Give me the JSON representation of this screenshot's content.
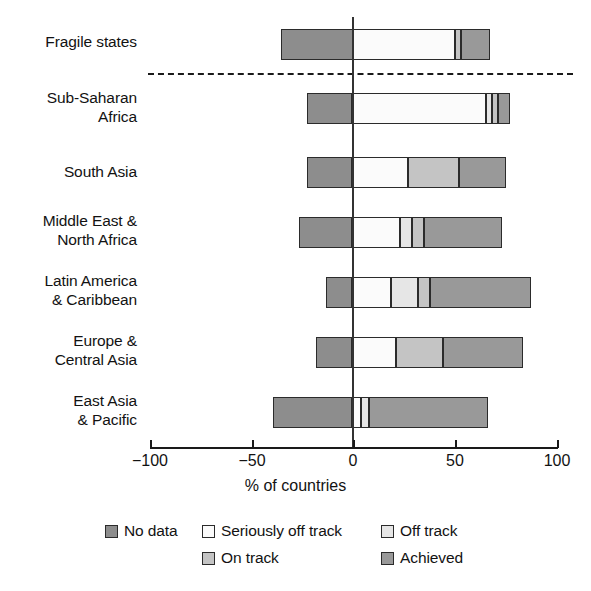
{
  "chart_data": {
    "type": "bar",
    "orientation": "horizontal",
    "stacked": true,
    "diverging": true,
    "title": "",
    "subtitle": "",
    "xlabel": "% of countries",
    "ylabel": "",
    "xlim": [
      -100,
      100
    ],
    "xticks": [
      -100,
      -50,
      0,
      50,
      100
    ],
    "xtick_labels": [
      "−100",
      "−50",
      "0",
      "50",
      "100"
    ],
    "grid": false,
    "legend_position": "bottom",
    "categories": [
      "Fragile states",
      "Sub-Saharan\nAfrica",
      "South Asia",
      "Middle East &\nNorth Africa",
      "Latin America\n& Caribbean",
      "Europe &\nCentral Asia",
      "East Asia\n& Pacific"
    ],
    "series": [
      {
        "name": "No data",
        "color": "#8d8d8d",
        "values": [
          -35,
          -22,
          -22,
          -26,
          -13,
          -18,
          -39
        ]
      },
      {
        "name": "Seriously off track",
        "color": "#fbfbfb",
        "values": [
          50,
          65,
          27,
          23,
          19,
          21,
          4
        ]
      },
      {
        "name": "Off track",
        "color": "#e6e6e6",
        "values": [
          0,
          3,
          0,
          6,
          13,
          0,
          4
        ]
      },
      {
        "name": "On track",
        "color": "#c4c4c4",
        "values": [
          3,
          3,
          25,
          6,
          6,
          23,
          0
        ]
      },
      {
        "name": "Achieved",
        "color": "#999999",
        "values": [
          14,
          6,
          23,
          38,
          49,
          39,
          58
        ]
      }
    ],
    "annotations": [
      {
        "type": "dashed-separator",
        "after_category": "Fragile states"
      }
    ],
    "row_totals_positive": [
      67,
      77,
      75,
      73,
      87,
      83,
      66
    ],
    "row_totals_negative": [
      -35,
      -22,
      -22,
      -26,
      -13,
      -18,
      -39
    ]
  },
  "axis": {
    "x_title": "% of countries",
    "ticks": [
      "−100",
      "−50",
      "0",
      "50",
      "100"
    ]
  },
  "legend": {
    "rows": [
      [
        {
          "label": "No data",
          "color": "#8d8d8d"
        },
        {
          "label": "Seriously off track",
          "color": "#fbfbfb"
        },
        {
          "label": "Off track",
          "color": "#e6e6e6"
        }
      ],
      [
        {
          "label": "On track",
          "color": "#c4c4c4"
        },
        {
          "label": "Achieved",
          "color": "#999999"
        }
      ]
    ]
  }
}
